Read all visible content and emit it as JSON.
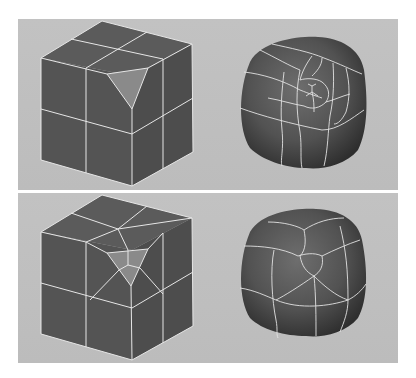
{
  "figure": {
    "caption_cutoff": "",
    "colors": {
      "page_background": "#ffffff",
      "viewport_background": "#bfbfbf",
      "face_dark": "#565656",
      "face_top": "#5a5a5a",
      "face_right": "#4f4f4f",
      "highlight_face": "#8a8a8a",
      "wire": "#e6e6e6"
    },
    "panels": [
      {
        "name": "before",
        "left_model": "cube-with-triangle-face",
        "right_model": "smoothed-cube-with-triangle-pole",
        "description": "Triangle face on cube corner; smoothed result shows pinched pole"
      },
      {
        "name": "after",
        "left_model": "cube-with-triangle-split-into-quads",
        "right_model": "smoothed-cube-with-quad-triangle",
        "description": "Triangle subdivided into three quads; smoothed result is cleaner"
      }
    ]
  }
}
